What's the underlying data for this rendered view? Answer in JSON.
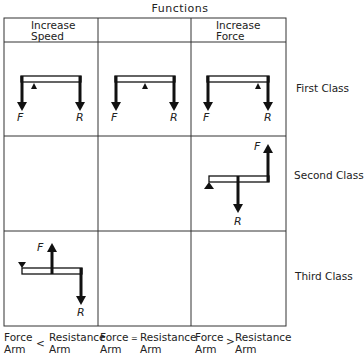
{
  "title": "Functions",
  "columns": [
    {
      "label_line1": "Increase",
      "label_line2": "Speed"
    },
    {
      "label_line1": "",
      "label_line2": ""
    },
    {
      "label_line1": "Increase",
      "label_line2": "Force"
    }
  ],
  "rows": [
    {
      "label": "First Class"
    },
    {
      "label": "Second Class"
    },
    {
      "label": "Third Class"
    }
  ],
  "force_label": "F",
  "resistance_label": "R",
  "footer": [
    {
      "left_top": "Force",
      "left_bottom": "Arm",
      "symbol": "<",
      "right_top": "Resistance",
      "right_bottom": "Arm"
    },
    {
      "left_top": "Force",
      "left_bottom": "Arm",
      "symbol": "=",
      "right_top": "Resistance",
      "right_bottom": "Arm"
    },
    {
      "left_top": "Force",
      "left_bottom": "Arm",
      "symbol": ">",
      "right_top": "Resistance",
      "right_bottom": "Arm"
    }
  ],
  "colors": {
    "line": "#333333",
    "arrow": "#111111",
    "text": "#222222"
  }
}
